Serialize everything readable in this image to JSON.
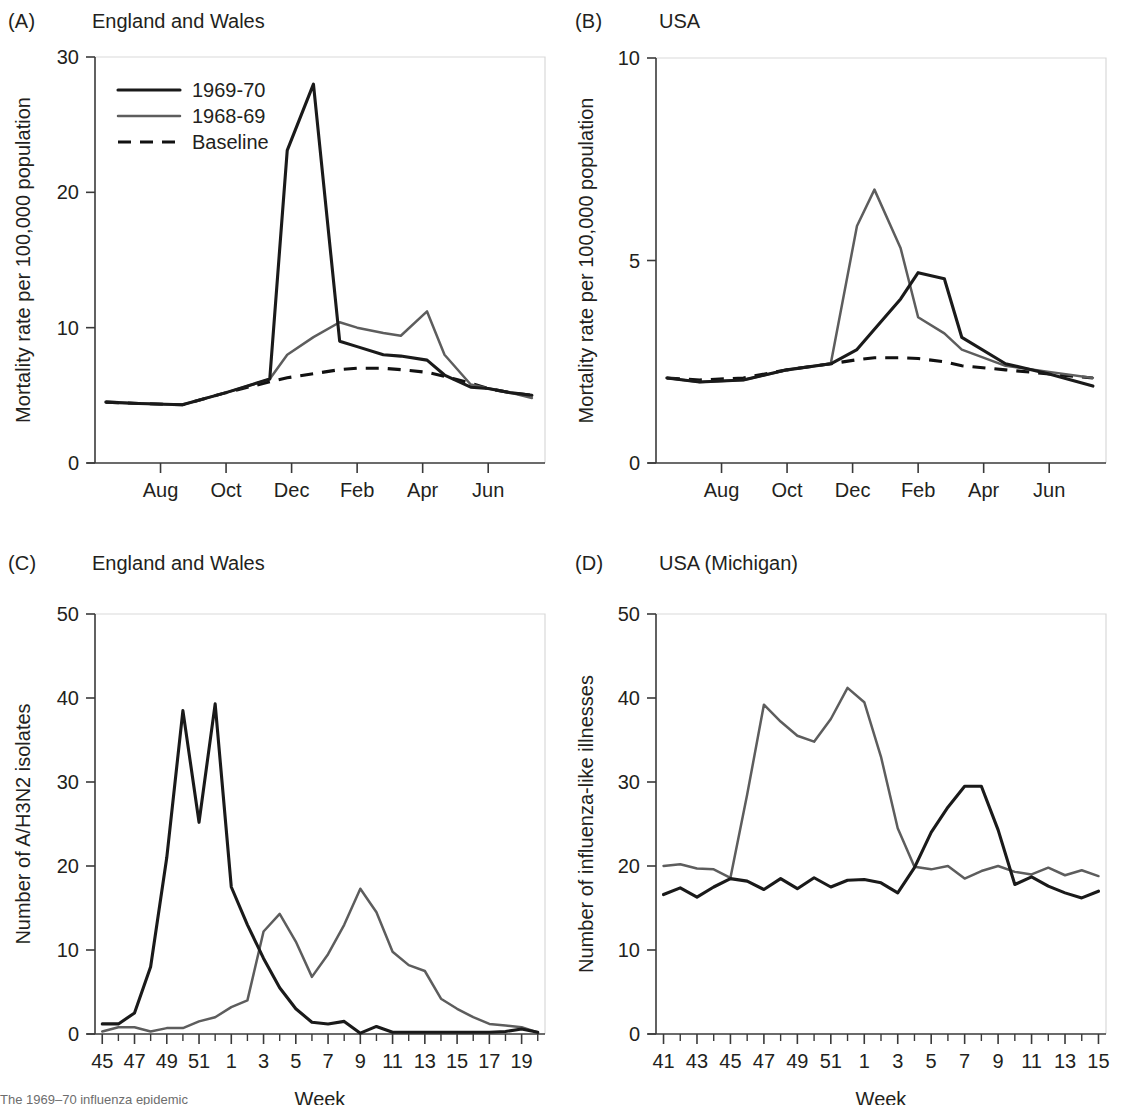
{
  "figure": {
    "caption_partial": "The 1969–70 influenza epidemic"
  },
  "colors": {
    "series_1969_70": "#1a1a1a",
    "series_1968_69": "#5d5d5d",
    "baseline": "#111111",
    "axis": "#3a3a3a",
    "text": "#231f20"
  },
  "panels": {
    "a": {
      "label": "(A)",
      "title": "England and Wales"
    },
    "b": {
      "label": "(B)",
      "title": "USA"
    },
    "c": {
      "label": "(C)",
      "title": "England and Wales"
    },
    "d": {
      "label": "(D)",
      "title": "USA (Michigan)"
    }
  },
  "legend": {
    "items": [
      {
        "label": "1969-70",
        "style": "solid-black"
      },
      {
        "label": "1968-69",
        "style": "solid-gray"
      },
      {
        "label": "Baseline",
        "style": "dashed-black"
      }
    ]
  },
  "chart_data": [
    {
      "panel": "A",
      "type": "line",
      "title": "England and Wales",
      "xlabel": "",
      "ylabel": "Mortality rate per 100,000 population",
      "ylim": [
        0,
        30
      ],
      "yticks": [
        0,
        10,
        20,
        30
      ],
      "xticks": [
        "Aug",
        "Oct",
        "Dec",
        "Feb",
        "Apr",
        "Jun"
      ],
      "x": [
        0.25,
        1,
        2,
        3,
        4,
        4.4,
        5,
        5.6,
        6,
        6.6,
        7,
        7.6,
        8,
        8.6,
        9,
        9.5,
        10
      ],
      "grid": false,
      "legend": [
        "1969-70",
        "1968-69",
        "Baseline"
      ],
      "series": [
        {
          "name": "1969-70",
          "style": "solid-black",
          "values": [
            4.5,
            4.4,
            4.3,
            5.2,
            6.2,
            23.1,
            28.0,
            9.0,
            8.6,
            8.0,
            7.9,
            7.6,
            6.5,
            5.6,
            5.5,
            5.2,
            5.0
          ]
        },
        {
          "name": "1968-69",
          "style": "solid-gray",
          "values": [
            4.5,
            4.4,
            4.3,
            5.2,
            6.2,
            8.0,
            9.3,
            10.4,
            10.0,
            9.6,
            9.4,
            11.2,
            8.0,
            5.8,
            5.5,
            5.2,
            4.8
          ]
        },
        {
          "name": "Baseline",
          "style": "dashed-black",
          "values": [
            4.5,
            4.4,
            4.3,
            5.2,
            6.0,
            6.3,
            6.6,
            6.9,
            7.0,
            7.0,
            6.9,
            6.7,
            6.4,
            5.9,
            5.5,
            5.2,
            5.0
          ]
        }
      ]
    },
    {
      "panel": "B",
      "type": "line",
      "title": "USA",
      "xlabel": "",
      "ylabel": "Mortality rate per 100,000 population",
      "ylim": [
        0,
        10
      ],
      "yticks": [
        0,
        5,
        10
      ],
      "xticks": [
        "Aug",
        "Oct",
        "Dec",
        "Feb",
        "Apr",
        "Jun"
      ],
      "x": [
        0.25,
        1,
        2,
        3,
        4,
        4.6,
        5,
        5.6,
        6,
        6.6,
        7,
        8,
        9,
        10
      ],
      "grid": false,
      "legend": [
        "1969-70",
        "1968-69",
        "Baseline"
      ],
      "series": [
        {
          "name": "1969-70",
          "style": "solid-black",
          "values": [
            2.1,
            2.0,
            2.05,
            2.3,
            2.45,
            2.8,
            3.3,
            4.05,
            4.7,
            4.55,
            3.1,
            2.45,
            2.2,
            1.9
          ]
        },
        {
          "name": "1968-69",
          "style": "solid-gray",
          "values": [
            2.1,
            2.0,
            2.05,
            2.3,
            2.45,
            5.85,
            6.75,
            5.3,
            3.6,
            3.2,
            2.8,
            2.4,
            2.25,
            2.1
          ]
        },
        {
          "name": "Baseline",
          "style": "dashed-black",
          "values": [
            2.1,
            2.05,
            2.1,
            2.3,
            2.45,
            2.55,
            2.6,
            2.6,
            2.58,
            2.5,
            2.4,
            2.3,
            2.2,
            2.1
          ]
        }
      ]
    },
    {
      "panel": "C",
      "type": "line",
      "title": "England and Wales",
      "xlabel": "Week",
      "ylabel": "Number of A/H3N2 isolates",
      "ylim": [
        0,
        50
      ],
      "yticks": [
        0,
        10,
        20,
        30,
        40,
        50
      ],
      "xticks": [
        45,
        47,
        49,
        51,
        1,
        3,
        5,
        7,
        9,
        11,
        13,
        15,
        17,
        19
      ],
      "weeks": [
        45,
        46,
        47,
        48,
        49,
        50,
        51,
        52,
        1,
        2,
        3,
        4,
        5,
        6,
        7,
        8,
        9,
        10,
        11,
        12,
        13,
        14,
        15,
        16,
        17,
        18,
        19,
        20
      ],
      "grid": false,
      "series": [
        {
          "name": "1969-70",
          "style": "solid-black",
          "values": [
            1.2,
            1.2,
            2.5,
            8.0,
            21.0,
            38.5,
            25.2,
            39.3,
            17.5,
            13.0,
            9.0,
            5.5,
            3.0,
            1.4,
            1.2,
            1.5,
            0.1,
            0.9,
            0.2,
            0.2,
            0.2,
            0.2,
            0.2,
            0.2,
            0.2,
            0.3,
            0.6,
            0.2
          ]
        },
        {
          "name": "1968-69",
          "style": "solid-gray",
          "values": [
            0.3,
            0.8,
            0.8,
            0.3,
            0.7,
            0.7,
            1.5,
            2.0,
            3.2,
            4.0,
            12.2,
            14.3,
            11.0,
            6.8,
            9.5,
            13.0,
            17.3,
            14.5,
            9.8,
            8.2,
            7.5,
            4.2,
            3.0,
            2.0,
            1.2,
            1.0,
            0.8,
            0.2
          ]
        }
      ]
    },
    {
      "panel": "D",
      "type": "line",
      "title": "USA (Michigan)",
      "xlabel": "Week",
      "ylabel": "Number of influenza-like illnesses",
      "ylim": [
        0,
        50
      ],
      "yticks": [
        0,
        10,
        20,
        30,
        40,
        50
      ],
      "xticks": [
        41,
        43,
        45,
        47,
        49,
        51,
        1,
        3,
        5,
        7,
        9,
        11,
        13,
        15
      ],
      "weeks": [
        41,
        42,
        43,
        44,
        45,
        46,
        47,
        48,
        49,
        50,
        51,
        52,
        1,
        2,
        3,
        4,
        5,
        6,
        7,
        8,
        9,
        10,
        11,
        12,
        13,
        14,
        15
      ],
      "grid": false,
      "series": [
        {
          "name": "1969-70",
          "style": "solid-black",
          "values": [
            16.6,
            17.4,
            16.3,
            17.5,
            18.5,
            18.2,
            17.2,
            18.5,
            17.3,
            18.6,
            17.5,
            18.3,
            18.4,
            18.0,
            16.8,
            19.8,
            24.0,
            27.0,
            29.5,
            29.5,
            24.3,
            17.8,
            18.7,
            17.6,
            16.8,
            16.2,
            17.0
          ]
        },
        {
          "name": "1968-69",
          "style": "solid-gray",
          "values": [
            20.0,
            20.2,
            19.7,
            19.6,
            18.6,
            28.5,
            39.2,
            37.2,
            35.5,
            34.8,
            37.5,
            41.2,
            39.5,
            33.0,
            24.5,
            19.9,
            19.6,
            20.0,
            18.5,
            19.4,
            20.0,
            19.3,
            19.0,
            19.8,
            18.9,
            19.5,
            18.8
          ]
        }
      ]
    }
  ]
}
